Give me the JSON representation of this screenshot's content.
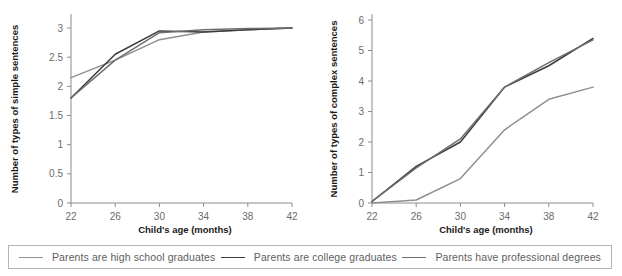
{
  "figure": {
    "background": "#ffffff",
    "axis_color": "#8c8c8c",
    "tick_label_color": "#6b6b6b",
    "axis_title_color": "#1a1a1a"
  },
  "legend": {
    "border_color": "#b5b5b5",
    "position": "bottom",
    "entries": [
      {
        "label": "Parents are high school graduates",
        "color": "#8f8f8f"
      },
      {
        "label": "Parents are college graduates",
        "color": "#3c3c3c"
      },
      {
        "label": "Parents have professional degrees",
        "color": "#6e6e6e"
      }
    ]
  },
  "chart_data": [
    {
      "id": "simple-sentences",
      "type": "line",
      "title": "",
      "xlabel": "Child's age (months)",
      "ylabel": "Number of types of simple sentences",
      "x": [
        22,
        26,
        30,
        34,
        38,
        42
      ],
      "xticklabels": [
        "22",
        "26",
        "30",
        "34",
        "38",
        "42"
      ],
      "xlim": [
        22,
        42
      ],
      "ylim": [
        0,
        3
      ],
      "yticks": [
        0,
        0.5,
        1,
        1.5,
        2,
        2.5,
        3
      ],
      "yticklabels": [
        "0",
        "0.5",
        "1",
        "1.5",
        "2",
        "2.5",
        "3"
      ],
      "grid": false,
      "series": [
        {
          "name": "Parents are high school graduates",
          "color": "#8f8f8f",
          "values": [
            2.15,
            2.45,
            2.8,
            2.93,
            2.97,
            3.0
          ]
        },
        {
          "name": "Parents are college graduates",
          "color": "#3c3c3c",
          "values": [
            1.8,
            2.55,
            2.95,
            2.93,
            2.97,
            3.0
          ]
        },
        {
          "name": "Parents have professional degrees",
          "color": "#6e6e6e",
          "values": [
            1.8,
            2.45,
            2.92,
            2.97,
            2.99,
            3.0
          ]
        }
      ]
    },
    {
      "id": "complex-sentences",
      "type": "line",
      "title": "",
      "xlabel": "Child's age (months)",
      "ylabel": "Number of types of complex sentences",
      "x": [
        22,
        26,
        30,
        34,
        38,
        42
      ],
      "xticklabels": [
        "22",
        "26",
        "30",
        "34",
        "38",
        "42"
      ],
      "xlim": [
        22,
        42
      ],
      "ylim": [
        0,
        6
      ],
      "yticks": [
        0,
        1,
        2,
        3,
        4,
        5,
        6
      ],
      "yticklabels": [
        "0",
        "1",
        "2",
        "3",
        "4",
        "5",
        "6"
      ],
      "grid": false,
      "series": [
        {
          "name": "Parents are high school graduates",
          "color": "#8f8f8f",
          "values": [
            0.0,
            0.1,
            0.8,
            2.4,
            3.4,
            3.8
          ]
        },
        {
          "name": "Parents are college graduates",
          "color": "#3c3c3c",
          "values": [
            0.05,
            1.2,
            2.0,
            3.8,
            4.5,
            5.4
          ]
        },
        {
          "name": "Parents have professional degrees",
          "color": "#6e6e6e",
          "values": [
            0.05,
            1.15,
            2.1,
            3.8,
            4.6,
            5.35
          ]
        }
      ]
    }
  ]
}
